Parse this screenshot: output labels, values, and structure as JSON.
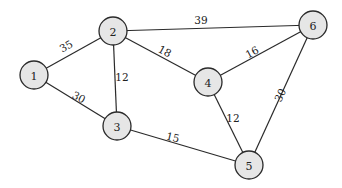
{
  "graph": {
    "nodes": [
      {
        "id": "1",
        "label": "1",
        "x": 34,
        "y": 75
      },
      {
        "id": "2",
        "label": "2",
        "x": 113,
        "y": 31
      },
      {
        "id": "3",
        "label": "3",
        "x": 117,
        "y": 126
      },
      {
        "id": "4",
        "label": "4",
        "x": 208,
        "y": 82
      },
      {
        "id": "5",
        "label": "5",
        "x": 249,
        "y": 165
      },
      {
        "id": "6",
        "label": "6",
        "x": 313,
        "y": 25
      }
    ],
    "edges": [
      {
        "from": "1",
        "to": "2",
        "weight": "35",
        "lx": 66,
        "ly": 46,
        "rot": -30
      },
      {
        "from": "1",
        "to": "3",
        "weight": "30",
        "lx": 79,
        "ly": 97,
        "rot": 28
      },
      {
        "from": "2",
        "to": "3",
        "weight": "12",
        "lx": 122,
        "ly": 77,
        "rot": 0
      },
      {
        "from": "2",
        "to": "4",
        "weight": "18",
        "lx": 165,
        "ly": 51,
        "rot": 28
      },
      {
        "from": "2",
        "to": "6",
        "weight": "39",
        "lx": 201,
        "ly": 20,
        "rot": 0
      },
      {
        "from": "3",
        "to": "5",
        "weight": "15",
        "lx": 173,
        "ly": 137,
        "rot": 13
      },
      {
        "from": "4",
        "to": "6",
        "weight": "16",
        "lx": 252,
        "ly": 52,
        "rot": -28
      },
      {
        "from": "4",
        "to": "5",
        "weight": "12",
        "lx": 233,
        "ly": 118,
        "rot": 0
      },
      {
        "from": "6",
        "to": "5",
        "weight": "30",
        "lx": 280,
        "ly": 95,
        "rot": -64
      }
    ]
  }
}
